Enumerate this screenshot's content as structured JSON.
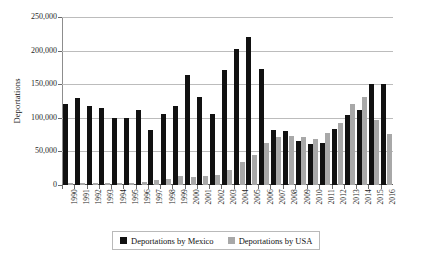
{
  "chart_data": {
    "type": "bar",
    "title": "",
    "xlabel": "",
    "ylabel": "Deportations",
    "ylim": [
      0,
      250000
    ],
    "ytick_values": [
      0,
      50000,
      100000,
      150000,
      200000,
      250000
    ],
    "ytick_labels": [
      "0",
      "50,000",
      "100,000",
      "150,000",
      "200,000",
      "250,000"
    ],
    "grid": true,
    "legend_position": "bottom",
    "categories": [
      "1990",
      "1991",
      "1992",
      "1993",
      "1994",
      "1995",
      "1996",
      "1997",
      "1998",
      "1999",
      "2000",
      "2001",
      "2002",
      "2003",
      "2004",
      "2005",
      "2006",
      "2007",
      "2008",
      "2009",
      "2010",
      "2011",
      "2012",
      "2013",
      "2014",
      "2015",
      "2016"
    ],
    "series": [
      {
        "name": "Deportations by Mexico",
        "color": "#111111",
        "values": [
          120000,
          130000,
          117000,
          114000,
          99000,
          99000,
          111000,
          82000,
          106000,
          117000,
          163000,
          131000,
          105000,
          171000,
          202000,
          221000,
          173000,
          82000,
          80000,
          65000,
          61000,
          62000,
          84000,
          104000,
          112000,
          151000,
          150000
        ]
      },
      {
        "name": "Deportations by USA",
        "color": "#a8a8a8",
        "values": [
          3000,
          3000,
          3000,
          3000,
          3000,
          3000,
          4000,
          7000,
          9000,
          13000,
          12000,
          14000,
          15000,
          23000,
          34000,
          45000,
          62000,
          71000,
          73000,
          72000,
          69000,
          78000,
          93000,
          120000,
          131000,
          97000,
          76000
        ]
      }
    ]
  },
  "legend": {
    "items": [
      {
        "label": "Deportations by Mexico",
        "color": "#111111"
      },
      {
        "label": "Deportations by USA",
        "color": "#a8a8a8"
      }
    ]
  }
}
